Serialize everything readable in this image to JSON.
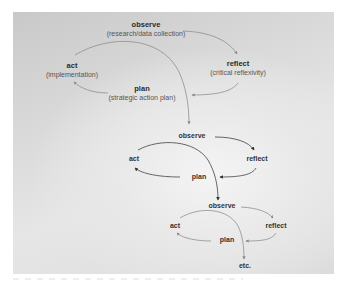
{
  "diagram": {
    "type": "action research spiral",
    "cycles": [
      {
        "observe": {
          "title": "observe",
          "subtitle": "(research/data collection)"
        },
        "reflect": {
          "title": "reflect",
          "subtitle": "(critical reflexivity)"
        },
        "plan": {
          "title": "plan",
          "subtitle": "(strategic action plan)"
        },
        "act": {
          "title": "act",
          "subtitle": "(implementation)"
        }
      },
      {
        "observe": {
          "title": "observe"
        },
        "reflect": {
          "title": "reflect"
        },
        "plan": {
          "title": "plan"
        },
        "act": {
          "title": "act"
        }
      },
      {
        "observe": {
          "title": "observe"
        },
        "reflect": {
          "title": "reflect"
        },
        "plan": {
          "title": "plan"
        },
        "act": {
          "title": "act"
        }
      }
    ],
    "continuation": "etc."
  },
  "colors": {
    "arrow": "#7a7a7a",
    "arrow_dark": "#3c3c3c",
    "text": "#333333",
    "panel_dark": "#c9c9c9",
    "panel_light": "#f4f4f4"
  }
}
